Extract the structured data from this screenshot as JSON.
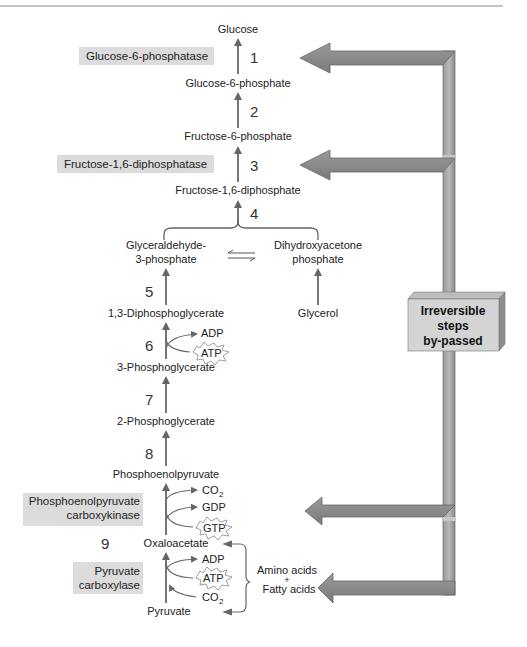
{
  "metabolites": {
    "glucose": "Glucose",
    "g6p": "Glucose-6-phosphate",
    "f6p": "Fructose-6-phosphate",
    "f16dp": "Fructose-1,6-diphosphate",
    "gap1": "Glyceraldehyde-",
    "gap2": "3-phosphate",
    "dhap1": "Dihydroxyacetone",
    "dhap2": "phosphate",
    "bpg": "1,3-Diphosphoglycerate",
    "glycerol": "Glycerol",
    "pg3": "3-Phosphoglycerate",
    "pg2": "2-Phosphoglycerate",
    "pep": "Phosphoenolpyruvate",
    "oaa": "Oxaloacetate",
    "pyruvate": "Pyruvate",
    "amino": "Amino acids",
    "plus": "+",
    "fatty": "Fatty acids"
  },
  "steps": [
    "1",
    "2",
    "3",
    "4",
    "5",
    "6",
    "7",
    "8",
    "9"
  ],
  "enzymes": {
    "g6pase": "Glucose-6-phosphatase",
    "fdpase": "Fructose-1,6-diphosphatase",
    "pepck1": "Phosphoenolpyruvate",
    "pepck2": "carboxykinase",
    "pc1": "Pyruvate",
    "pc2": "carboxylase"
  },
  "cofactors": {
    "adp6": "ADP",
    "atp6": "ATP",
    "co2_top": "CO",
    "gdp": "GDP",
    "gtp": "GTP",
    "adp9": "ADP",
    "atp9": "ATP",
    "co2_bot": "CO",
    "sub2": "2"
  },
  "callout": {
    "line1": "Irreversible",
    "line2": "steps",
    "line3": "by-passed"
  },
  "colors": {
    "arrow": "#6e6e6e",
    "big_arrow": "#8c8c8c",
    "enzyme_bg": "#dcdcdc",
    "box_bg": "#d4d4d4"
  }
}
